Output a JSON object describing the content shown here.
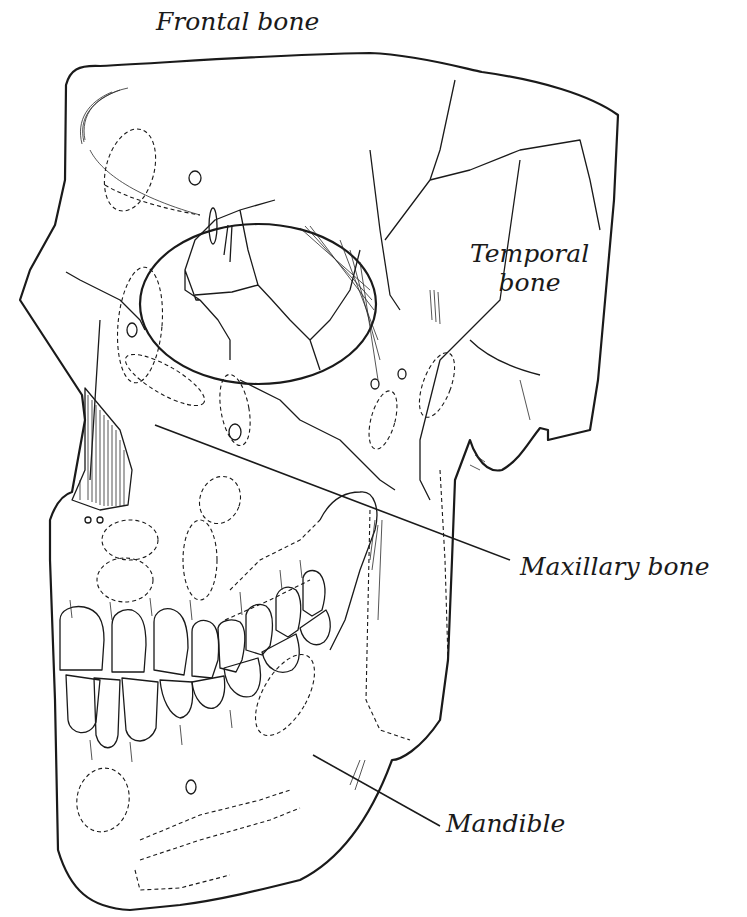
{
  "diagram": {
    "background": "#ffffff",
    "line_color": "#1a1a1a",
    "labels": [
      {
        "id": "frontal",
        "text": "Frontal bone",
        "lines": [
          "Frontal bone"
        ]
      },
      {
        "id": "temporal",
        "text": "Temporal bone",
        "lines": [
          "Temporal",
          "bone"
        ]
      },
      {
        "id": "maxillary",
        "text": "Maxillary bone",
        "lines": [
          "Maxillary bone"
        ]
      },
      {
        "id": "mandible",
        "text": "Mandible",
        "lines": [
          "Mandible"
        ]
      }
    ],
    "leaders": [
      {
        "label": "maxillary",
        "from": [
          155,
          425
        ],
        "to": [
          510,
          560
        ]
      },
      {
        "label": "mandible",
        "from": [
          313,
          855
        ],
        "to": [
          440,
          826
        ]
      }
    ]
  }
}
